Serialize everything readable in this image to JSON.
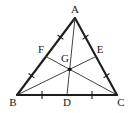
{
  "figure": {
    "kind": "geometry-diagram",
    "shape": "triangle",
    "background_color": "#ffffff",
    "stroke_color": "#1d1d1d",
    "median_color": "#2b2b2b",
    "label_color": "#1a1a1a"
  },
  "points": {
    "A": {
      "label": "A",
      "x": 75,
      "y": 18,
      "label_x": 75,
      "label_y": 13
    },
    "B": {
      "label": "B",
      "x": 17,
      "y": 95,
      "label_x": 13,
      "label_y": 106
    },
    "C": {
      "label": "C",
      "x": 117,
      "y": 95,
      "label_x": 121,
      "label_y": 106
    },
    "D": {
      "label": "D",
      "x": 67,
      "y": 95,
      "label_x": 67,
      "label_y": 106
    },
    "E": {
      "label": "E",
      "x": 96,
      "y": 56.5,
      "label_x": 100,
      "label_y": 53
    },
    "F": {
      "label": "F",
      "x": 46,
      "y": 56.5,
      "label_x": 41,
      "label_y": 53
    },
    "G": {
      "label": "G",
      "x": 69.7,
      "y": 69.3,
      "label_x": 65,
      "label_y": 62
    }
  },
  "segments": {
    "sides": [
      {
        "name": "side-AB",
        "from": "A",
        "to": "B"
      },
      {
        "name": "side-AC",
        "from": "A",
        "to": "C"
      },
      {
        "name": "side-BC",
        "from": "B",
        "to": "C"
      }
    ],
    "medians": [
      {
        "name": "median-AD",
        "from": "A",
        "to": "D"
      },
      {
        "name": "median-BE",
        "from": "B",
        "to": "E"
      },
      {
        "name": "median-CF",
        "from": "C",
        "to": "F"
      }
    ]
  },
  "tick_marks": [
    {
      "name": "tick-BD",
      "on": "BC",
      "x": 42,
      "y": 95
    },
    {
      "name": "tick-DC",
      "on": "BC",
      "x": 92,
      "y": 95
    },
    {
      "name": "tick-AF",
      "on": "AB",
      "x": 60.5,
      "y": 37.2
    },
    {
      "name": "tick-FB",
      "on": "AB",
      "x": 31.5,
      "y": 75.7
    },
    {
      "name": "tick-AE",
      "on": "AC",
      "x": 85.5,
      "y": 37.2
    },
    {
      "name": "tick-EC",
      "on": "AC",
      "x": 106.5,
      "y": 75.7
    }
  ]
}
